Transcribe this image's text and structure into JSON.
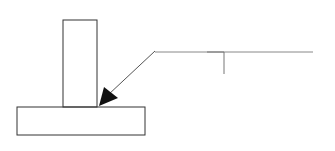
{
  "diagram": {
    "type": "welding-symbol",
    "colors": {
      "background": "#ffffff",
      "outline": "#333333",
      "leader": "#555555",
      "reference_line": "#888888",
      "arrowhead": "#111111"
    },
    "vertical_plate": {
      "x": 63,
      "y": 20,
      "width": 34,
      "height": 87
    },
    "base_plate": {
      "x": 17,
      "y": 107,
      "width": 128,
      "height": 28
    },
    "leader_line": {
      "x1": 155,
      "y1": 51,
      "x2": 108,
      "y2": 95
    },
    "arrowhead": {
      "points": "99,106 104,87 118,98"
    },
    "reference_line": {
      "x1": 155,
      "y1": 52,
      "x2": 313,
      "y2": 52
    },
    "fillet_weld_symbol": {
      "points": "207,52 224,52 224,74"
    }
  }
}
